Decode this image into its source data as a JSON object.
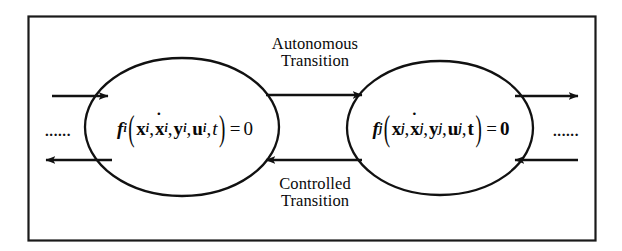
{
  "figure": {
    "type": "state-transition-diagram",
    "title": "",
    "background_color": "#ffffff",
    "line_color": "#111111",
    "border": {
      "name": "figure-frame",
      "x": 28,
      "y": 16,
      "width": 567,
      "height": 224
    }
  },
  "nodes": [
    {
      "id": "left-state",
      "shape": "ellipse",
      "cx": 182,
      "cy": 127,
      "rx": 97,
      "ry": 69,
      "formula": {
        "function": "f",
        "function_subscript": "i",
        "arguments": [
          "x",
          "x_dot",
          "y",
          "u",
          "t"
        ],
        "argument_subscript": "i",
        "equals": "0",
        "plain_text": "f_i(x_i, ẋ_i, y_i, u_i, t) = 0"
      }
    },
    {
      "id": "right-state",
      "shape": "ellipse",
      "cx": 440,
      "cy": 128,
      "rx": 93,
      "ry": 67,
      "formula": {
        "function": "f",
        "function_subscript": "j",
        "arguments": [
          "x",
          "x_dot",
          "y",
          "u",
          "t"
        ],
        "argument_subscript": "j",
        "equals": "0",
        "plain_text": "f_j(x_j, ẋ_j, y_j, u_j, t) = 0"
      }
    }
  ],
  "edges": [
    {
      "id": "autonomous-transition",
      "from": "left-state",
      "to": "right-state",
      "direction": "right",
      "label_lines": [
        "Autonomous",
        "Transition"
      ],
      "label": "Autonomous Transition"
    },
    {
      "id": "controlled-transition",
      "from": "right-state",
      "to": "left-state",
      "direction": "left",
      "label_lines": [
        "Controlled",
        "Transition"
      ],
      "label": "Controlled Transition"
    }
  ],
  "external_arrows": [
    {
      "id": "left-inbound-arrow",
      "side": "left",
      "direction": "right",
      "y": 96
    },
    {
      "id": "left-outbound-arrow",
      "side": "left",
      "direction": "left",
      "y": 160
    },
    {
      "id": "right-outbound-arrow",
      "side": "right",
      "direction": "right",
      "y": 96
    },
    {
      "id": "right-inbound-arrow",
      "side": "right",
      "direction": "left",
      "y": 160
    }
  ],
  "ellipsis": {
    "left": "......",
    "right": "......"
  },
  "labels": {
    "autonomous_line1": "Autonomous",
    "autonomous_line2": "Transition",
    "controlled_line1": "Controlled",
    "controlled_line2": "Transition"
  },
  "formula_tokens": {
    "f": "f",
    "sub_i": "i",
    "sub_j": "j",
    "open_paren": "(",
    "close_paren": ")",
    "x": "x",
    "y": "y",
    "u": "u",
    "t": "t",
    "dot": "˙",
    "comma": ",",
    "equals": "=",
    "zero": "0"
  }
}
